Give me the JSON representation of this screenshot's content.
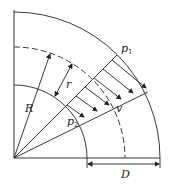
{
  "diagram": {
    "labels": {
      "p1": "p",
      "p1_sub": "1",
      "p2": "p",
      "p2_sub": "2",
      "R": "R",
      "r": "r",
      "v": "v",
      "D": "D"
    },
    "colors": {
      "line": "#222222",
      "background": "#ffffff"
    }
  }
}
